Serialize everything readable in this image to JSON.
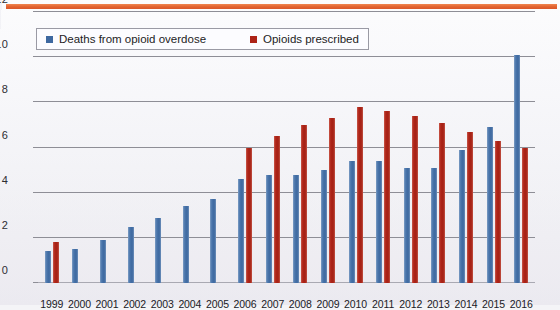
{
  "decor": {
    "top_rule_color": "#e2622f",
    "background_color": "#f2f2f6"
  },
  "legend": {
    "position": "top-left-inside",
    "entries": [
      {
        "label": "Deaths from opioid overdose",
        "color": "#3d68a0",
        "icon": "square-swatch-blue"
      },
      {
        "label": "Opioids prescribed",
        "color": "#ad2317",
        "icon": "square-swatch-red"
      }
    ]
  },
  "chart_data": {
    "type": "bar",
    "title": "",
    "subtitle": "",
    "xlabel": "",
    "ylabel": "",
    "ylim": [
      0,
      12
    ],
    "yticks": [
      0,
      2,
      4,
      6,
      8,
      10,
      12
    ],
    "grid": true,
    "legend_position": "top-left",
    "categories": [
      "1999",
      "2000",
      "2001",
      "2002",
      "2003",
      "2004",
      "2005",
      "2006",
      "2007",
      "2008",
      "2009",
      "2010",
      "2011",
      "2012",
      "2013",
      "2014",
      "2015",
      "2016"
    ],
    "series": [
      {
        "name": "Deaths from opioid overdose",
        "color": "#3d68a0",
        "values": [
          1.4,
          1.5,
          1.9,
          2.5,
          2.9,
          3.4,
          3.7,
          4.6,
          4.8,
          4.8,
          5.0,
          5.4,
          5.4,
          5.1,
          5.1,
          5.9,
          6.9,
          10.1
        ]
      },
      {
        "name": "Opioids prescribed",
        "color": "#ad2317",
        "values": [
          1.8,
          null,
          null,
          null,
          null,
          null,
          null,
          6.0,
          6.5,
          7.0,
          7.3,
          7.8,
          7.6,
          7.4,
          7.1,
          6.7,
          6.3,
          6.0
        ]
      }
    ]
  }
}
